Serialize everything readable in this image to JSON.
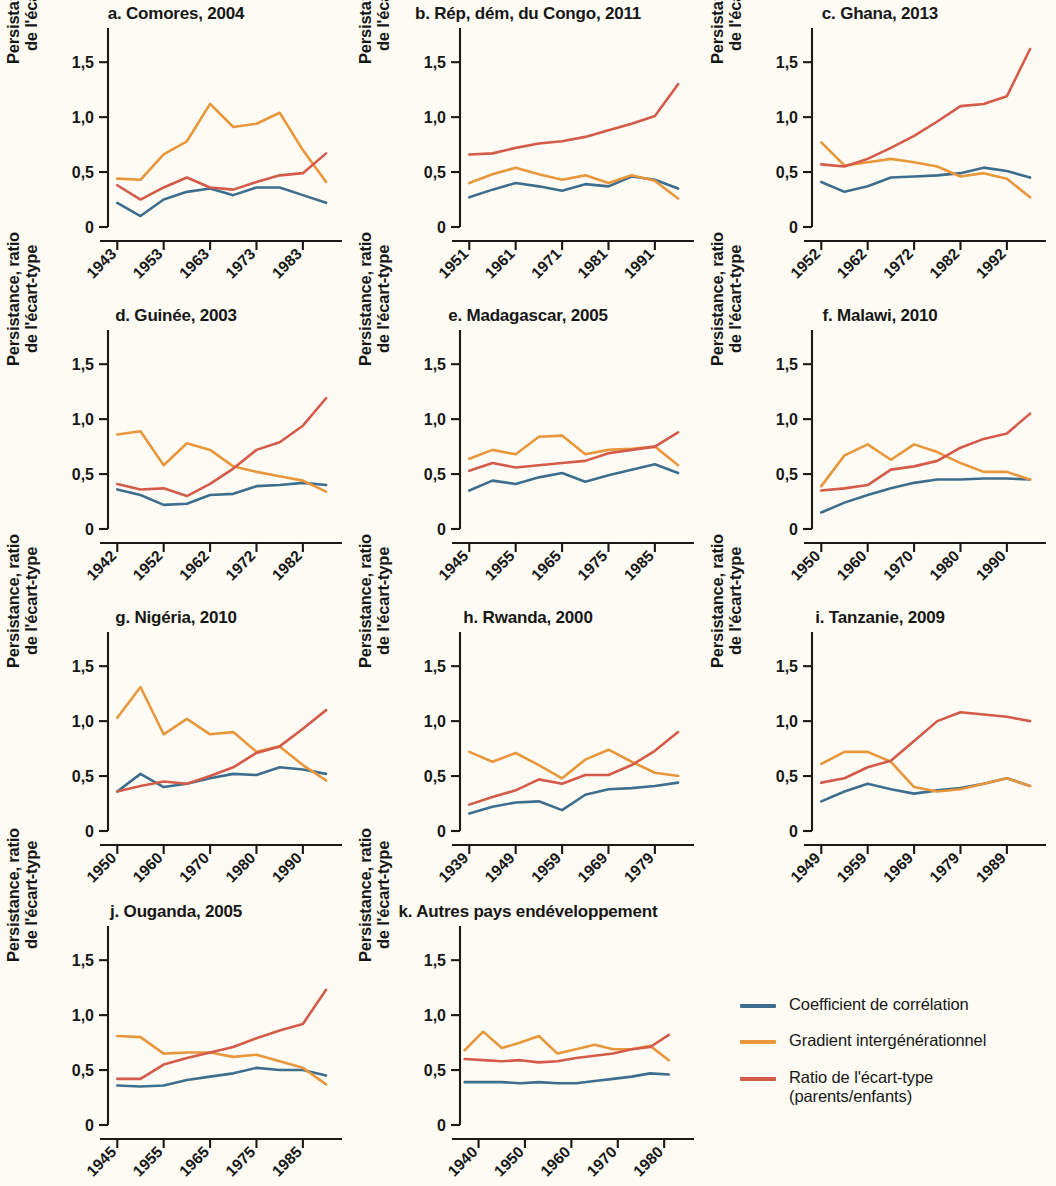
{
  "axis": {
    "ylabel_line1": "Persistance, ratio",
    "ylabel_line2": "de l'écart-type",
    "ytick_labels": [
      "1,5",
      "1,0",
      "0,5",
      "0"
    ],
    "ytick_values": [
      1.5,
      1.0,
      0.5,
      0
    ]
  },
  "legend": {
    "items": [
      {
        "label": "Coefficient de corrélation",
        "sub": "",
        "color": "#3d6e8e"
      },
      {
        "label": "Gradient intergénérationnel",
        "sub": "",
        "color": "#e8973c"
      },
      {
        "label": "Ratio de l'écart-type",
        "sub": "(parents/enfants)",
        "color": "#d45a4a"
      }
    ]
  },
  "chart_data": {
    "type": "line",
    "title": "",
    "ylabel": "Persistance, ratio de l'écart-type",
    "xlabel": "",
    "ylim": [
      0,
      1.72
    ],
    "yticks": [
      0,
      0.5,
      1.0,
      1.5
    ],
    "grid": false,
    "legend_position": "bottom-right",
    "series_names": [
      "Coefficient de corrélation",
      "Gradient intergénérationnel",
      "Ratio de l'écart-type (parents/enfants)"
    ],
    "series_colors": [
      "#3d6e8e",
      "#e8973c",
      "#d45a4a"
    ],
    "panels": [
      {
        "key": "a",
        "title": "a. Comores, 2004",
        "xticks": [
          "1943",
          "1953",
          "1963",
          "1973",
          "1983"
        ],
        "xtick_values": [
          1943,
          1953,
          1963,
          1973,
          1983
        ],
        "xlim": [
          1941,
          1991
        ],
        "x": [
          1943,
          1948,
          1953,
          1958,
          1963,
          1968,
          1973,
          1978,
          1983,
          1988
        ],
        "series": [
          {
            "name": "Coefficient de corrélation",
            "color": "#3d6e8e",
            "values": [
              0.22,
              0.1,
              0.25,
              0.32,
              0.35,
              0.29,
              0.36,
              0.36,
              0.29,
              0.22
            ]
          },
          {
            "name": "Gradient intergénérationnel",
            "color": "#e8973c",
            "values": [
              0.44,
              0.43,
              0.66,
              0.78,
              1.12,
              0.91,
              0.94,
              1.04,
              0.7,
              0.41
            ]
          },
          {
            "name": "Ratio de l'écart-type (parents/enfants)",
            "color": "#d45a4a",
            "values": [
              0.38,
              0.25,
              0.36,
              0.45,
              0.36,
              0.34,
              0.41,
              0.47,
              0.49,
              0.67
            ]
          }
        ]
      },
      {
        "key": "b",
        "title": "b. Rép, dém, du Congo, 2011",
        "xticks": [
          "1951",
          "1961",
          "1971",
          "1981",
          "1991"
        ],
        "xtick_values": [
          1951,
          1961,
          1971,
          1981,
          1991
        ],
        "xlim": [
          1949,
          1999
        ],
        "x": [
          1951,
          1956,
          1961,
          1966,
          1971,
          1976,
          1981,
          1986,
          1991,
          1996
        ],
        "series": [
          {
            "name": "Coefficient de corrélation",
            "color": "#3d6e8e",
            "values": [
              0.27,
              0.34,
              0.4,
              0.37,
              0.33,
              0.39,
              0.37,
              0.46,
              0.43,
              0.35
            ]
          },
          {
            "name": "Gradient intergénérationnel",
            "color": "#e8973c",
            "values": [
              0.4,
              0.48,
              0.54,
              0.48,
              0.43,
              0.47,
              0.4,
              0.47,
              0.42,
              0.26
            ]
          },
          {
            "name": "Ratio de l'écart-type (parents/enfants)",
            "color": "#d45a4a",
            "values": [
              0.66,
              0.67,
              0.72,
              0.76,
              0.78,
              0.82,
              0.88,
              0.94,
              1.01,
              1.3
            ]
          }
        ]
      },
      {
        "key": "c",
        "title": "c. Ghana, 2013",
        "xticks": [
          "1952",
          "1962",
          "1972",
          "1982",
          "1992"
        ],
        "xtick_values": [
          1952,
          1962,
          1972,
          1982,
          1992
        ],
        "xlim": [
          1950,
          2000
        ],
        "x": [
          1952,
          1957,
          1962,
          1967,
          1972,
          1977,
          1982,
          1987,
          1992,
          1997
        ],
        "series": [
          {
            "name": "Coefficient de corrélation",
            "color": "#3d6e8e",
            "values": [
              0.41,
              0.32,
              0.37,
              0.45,
              0.46,
              0.47,
              0.49,
              0.54,
              0.51,
              0.45
            ]
          },
          {
            "name": "Gradient intergénérationnel",
            "color": "#e8973c",
            "values": [
              0.77,
              0.56,
              0.59,
              0.62,
              0.59,
              0.55,
              0.46,
              0.49,
              0.44,
              0.27
            ]
          },
          {
            "name": "Ratio de l'écart-type (parents/enfants)",
            "color": "#d45a4a",
            "values": [
              0.57,
              0.55,
              0.62,
              0.72,
              0.83,
              0.96,
              1.1,
              1.12,
              1.19,
              1.62
            ]
          }
        ]
      },
      {
        "key": "d",
        "title": "d. Guinée, 2003",
        "xticks": [
          "1942",
          "1952",
          "1962",
          "1972",
          "1982"
        ],
        "xtick_values": [
          1942,
          1952,
          1962,
          1972,
          1982
        ],
        "xlim": [
          1940,
          1990
        ],
        "x": [
          1942,
          1947,
          1952,
          1957,
          1962,
          1967,
          1972,
          1977,
          1982,
          1987
        ],
        "series": [
          {
            "name": "Coefficient de corrélation",
            "color": "#3d6e8e",
            "values": [
              0.36,
              0.31,
              0.22,
              0.23,
              0.31,
              0.32,
              0.39,
              0.4,
              0.42,
              0.4
            ]
          },
          {
            "name": "Gradient intergénérationnel",
            "color": "#e8973c",
            "values": [
              0.86,
              0.89,
              0.58,
              0.78,
              0.72,
              0.57,
              0.52,
              0.48,
              0.44,
              0.34
            ]
          },
          {
            "name": "Ratio de l'écart-type (parents/enfants)",
            "color": "#d45a4a",
            "values": [
              0.41,
              0.36,
              0.37,
              0.3,
              0.41,
              0.55,
              0.72,
              0.79,
              0.94,
              1.19
            ]
          }
        ]
      },
      {
        "key": "e",
        "title": "e. Madagascar, 2005",
        "xticks": [
          "1945",
          "1955",
          "1965",
          "1975",
          "1985"
        ],
        "xtick_values": [
          1945,
          1955,
          1965,
          1975,
          1985
        ],
        "xlim": [
          1943,
          1993
        ],
        "x": [
          1945,
          1950,
          1955,
          1960,
          1965,
          1970,
          1975,
          1980,
          1985,
          1990
        ],
        "series": [
          {
            "name": "Coefficient de corrélation",
            "color": "#3d6e8e",
            "values": [
              0.35,
              0.44,
              0.41,
              0.47,
              0.51,
              0.43,
              0.49,
              0.54,
              0.59,
              0.51
            ]
          },
          {
            "name": "Gradient intergénérationnel",
            "color": "#e8973c",
            "values": [
              0.64,
              0.72,
              0.68,
              0.84,
              0.85,
              0.68,
              0.72,
              0.73,
              0.75,
              0.58
            ]
          },
          {
            "name": "Ratio de l'écart-type (parents/enfants)",
            "color": "#d45a4a",
            "values": [
              0.53,
              0.6,
              0.56,
              0.58,
              0.6,
              0.62,
              0.69,
              0.72,
              0.75,
              0.88
            ]
          }
        ]
      },
      {
        "key": "f",
        "title": "f. Malawi, 2010",
        "xticks": [
          "1950",
          "1960",
          "1970",
          "1980",
          "1990"
        ],
        "xtick_values": [
          1950,
          1960,
          1970,
          1980,
          1990
        ],
        "xlim": [
          1948,
          1998
        ],
        "x": [
          1950,
          1955,
          1960,
          1965,
          1970,
          1975,
          1980,
          1985,
          1990,
          1995
        ],
        "series": [
          {
            "name": "Coefficient de corrélation",
            "color": "#3d6e8e",
            "values": [
              0.15,
              0.24,
              0.31,
              0.37,
              0.42,
              0.45,
              0.45,
              0.46,
              0.46,
              0.45
            ]
          },
          {
            "name": "Gradient intergénérationnel",
            "color": "#e8973c",
            "values": [
              0.39,
              0.67,
              0.77,
              0.63,
              0.77,
              0.7,
              0.6,
              0.52,
              0.52,
              0.45
            ]
          },
          {
            "name": "Ratio de l'écart-type (parents/enfants)",
            "color": "#d45a4a",
            "values": [
              0.35,
              0.37,
              0.4,
              0.54,
              0.57,
              0.62,
              0.74,
              0.82,
              0.87,
              1.05
            ]
          }
        ]
      },
      {
        "key": "g",
        "title": "g. Nigéria, 2010",
        "xticks": [
          "1950",
          "1960",
          "1970",
          "1980",
          "1990"
        ],
        "xtick_values": [
          1950,
          1960,
          1970,
          1980,
          1990
        ],
        "xlim": [
          1948,
          1998
        ],
        "x": [
          1950,
          1955,
          1960,
          1965,
          1970,
          1975,
          1980,
          1985,
          1990,
          1995
        ],
        "series": [
          {
            "name": "Coefficient de corrélation",
            "color": "#3d6e8e",
            "values": [
              0.36,
              0.52,
              0.4,
              0.43,
              0.48,
              0.52,
              0.51,
              0.58,
              0.56,
              0.52
            ]
          },
          {
            "name": "Gradient intergénérationnel",
            "color": "#e8973c",
            "values": [
              1.03,
              1.31,
              0.88,
              1.02,
              0.88,
              0.9,
              0.72,
              0.77,
              0.6,
              0.46
            ]
          },
          {
            "name": "Ratio de l'écart-type (parents/enfants)",
            "color": "#d45a4a",
            "values": [
              0.36,
              0.41,
              0.45,
              0.43,
              0.5,
              0.58,
              0.71,
              0.77,
              0.93,
              1.1
            ]
          }
        ]
      },
      {
        "key": "h",
        "title": "h. Rwanda, 2000",
        "xticks": [
          "1939",
          "1949",
          "1959",
          "1969",
          "1979"
        ],
        "xtick_values": [
          1939,
          1949,
          1959,
          1969,
          1979
        ],
        "xlim": [
          1937,
          1987
        ],
        "x": [
          1939,
          1944,
          1949,
          1954,
          1959,
          1964,
          1969,
          1974,
          1979,
          1984
        ],
        "series": [
          {
            "name": "Coefficient de corrélation",
            "color": "#3d6e8e",
            "values": [
              0.16,
              0.22,
              0.26,
              0.27,
              0.19,
              0.33,
              0.38,
              0.39,
              0.41,
              0.44
            ]
          },
          {
            "name": "Gradient intergénérationnel",
            "color": "#e8973c",
            "values": [
              0.72,
              0.63,
              0.71,
              0.6,
              0.48,
              0.65,
              0.74,
              0.63,
              0.53,
              0.5
            ]
          },
          {
            "name": "Ratio de l'écart-type (parents/enfants)",
            "color": "#d45a4a",
            "values": [
              0.24,
              0.31,
              0.37,
              0.47,
              0.43,
              0.51,
              0.51,
              0.6,
              0.73,
              0.9
            ]
          }
        ]
      },
      {
        "key": "i",
        "title": "i. Tanzanie, 2009",
        "xticks": [
          "1949",
          "1959",
          "1969",
          "1979",
          "1989"
        ],
        "xtick_values": [
          1949,
          1959,
          1969,
          1979,
          1989
        ],
        "xlim": [
          1947,
          1997
        ],
        "x": [
          1949,
          1954,
          1959,
          1964,
          1969,
          1974,
          1979,
          1984,
          1989,
          1994
        ],
        "series": [
          {
            "name": "Coefficient de corrélation",
            "color": "#3d6e8e",
            "values": [
              0.27,
              0.36,
              0.43,
              0.38,
              0.34,
              0.37,
              0.39,
              0.43,
              0.48,
              0.41
            ]
          },
          {
            "name": "Gradient intergénérationnel",
            "color": "#e8973c",
            "values": [
              0.61,
              0.72,
              0.72,
              0.63,
              0.4,
              0.36,
              0.38,
              0.43,
              0.48,
              0.41
            ]
          },
          {
            "name": "Ratio de l'écart-type (parents/enfants)",
            "color": "#d45a4a",
            "values": [
              0.44,
              0.48,
              0.58,
              0.64,
              0.82,
              1.0,
              1.08,
              1.06,
              1.04,
              1.0
            ]
          }
        ]
      },
      {
        "key": "j",
        "title": "j. Ouganda, 2005",
        "xticks": [
          "1945",
          "1955",
          "1965",
          "1975",
          "1985"
        ],
        "xtick_values": [
          1945,
          1955,
          1965,
          1975,
          1985
        ],
        "xlim": [
          1943,
          1993
        ],
        "x": [
          1945,
          1950,
          1955,
          1960,
          1965,
          1970,
          1975,
          1980,
          1985,
          1990
        ],
        "series": [
          {
            "name": "Coefficient de corrélation",
            "color": "#3d6e8e",
            "values": [
              0.36,
              0.35,
              0.36,
              0.41,
              0.44,
              0.47,
              0.52,
              0.5,
              0.5,
              0.45
            ]
          },
          {
            "name": "Gradient intergénérationnel",
            "color": "#e8973c",
            "values": [
              0.81,
              0.8,
              0.65,
              0.66,
              0.66,
              0.62,
              0.64,
              0.58,
              0.52,
              0.37
            ]
          },
          {
            "name": "Ratio de l'écart-type (parents/enfants)",
            "color": "#d45a4a",
            "values": [
              0.42,
              0.42,
              0.55,
              0.61,
              0.66,
              0.71,
              0.79,
              0.86,
              0.92,
              1.23
            ]
          }
        ]
      },
      {
        "key": "k",
        "title": "k. Autres pays endéveloppement",
        "xticks": [
          "1940",
          "1950",
          "1960",
          "1970",
          "1980"
        ],
        "xtick_values": [
          1940,
          1950,
          1960,
          1970,
          1980
        ],
        "xlim": [
          1936,
          1986
        ],
        "x": [
          1937,
          1941,
          1945,
          1949,
          1953,
          1957,
          1961,
          1965,
          1969,
          1973,
          1977,
          1981
        ],
        "series": [
          {
            "name": "Coefficient de corrélation",
            "color": "#3d6e8e",
            "values": [
              0.39,
              0.39,
              0.39,
              0.38,
              0.39,
              0.38,
              0.38,
              0.4,
              0.42,
              0.44,
              0.47,
              0.46
            ]
          },
          {
            "name": "Gradient intergénérationnel",
            "color": "#e8973c",
            "values": [
              0.68,
              0.85,
              0.7,
              0.75,
              0.81,
              0.65,
              0.69,
              0.73,
              0.69,
              0.69,
              0.72,
              0.59
            ]
          },
          {
            "name": "Ratio de l'écart-type (parents/enfants)",
            "color": "#d45a4a",
            "values": [
              0.6,
              0.59,
              0.58,
              0.59,
              0.57,
              0.58,
              0.61,
              0.63,
              0.65,
              0.69,
              0.71,
              0.82
            ]
          }
        ]
      }
    ]
  }
}
